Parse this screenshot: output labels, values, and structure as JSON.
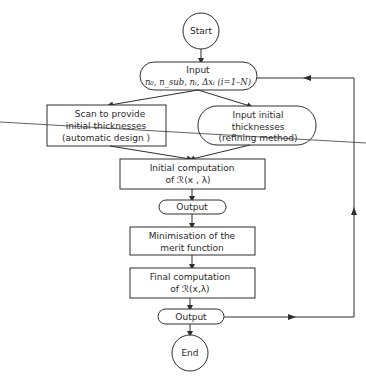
{
  "diagram": {
    "type": "flowchart",
    "nodes": {
      "start": {
        "label": "Start",
        "shape": "circle"
      },
      "input": {
        "title": "Input",
        "params": "n₀, n_sub, nᵢ, Δxᵢ (i=1–N)",
        "shape": "terminal"
      },
      "scan": {
        "lines": [
          "Scan to provide",
          "initial thicknesses",
          "(automatic design )"
        ],
        "shape": "rectangle"
      },
      "input_initial": {
        "lines": [
          "Input initial",
          "thicknesses",
          "(refining method)"
        ],
        "shape": "terminal"
      },
      "initial_computation": {
        "lines": [
          "Initial computation",
          "of  ℛ(x , λ)"
        ],
        "shape": "rectangle"
      },
      "output1": {
        "label": "Output",
        "shape": "terminal"
      },
      "minimisation": {
        "lines": [
          "Minimisation of the",
          "merit function"
        ],
        "shape": "rectangle"
      },
      "final_computation": {
        "lines": [
          "Final computation",
          "of  ℛ(x,λ)"
        ],
        "shape": "rectangle"
      },
      "output2": {
        "label": "Output",
        "shape": "terminal"
      },
      "end": {
        "label": "End",
        "shape": "circle"
      }
    },
    "edges": [
      [
        "start",
        "input"
      ],
      [
        "input",
        "scan"
      ],
      [
        "input",
        "input_initial"
      ],
      [
        "scan",
        "initial_computation"
      ],
      [
        "input_initial",
        "initial_computation"
      ],
      [
        "initial_computation",
        "output1"
      ],
      [
        "output1",
        "minimisation"
      ],
      [
        "minimisation",
        "final_computation"
      ],
      [
        "final_computation",
        "output2"
      ],
      [
        "output2",
        "end"
      ],
      [
        "output2",
        "input"
      ]
    ],
    "colors": {
      "stroke": "#2e2e2e",
      "text": "#2a2a2a",
      "background": "#ffffff"
    }
  }
}
